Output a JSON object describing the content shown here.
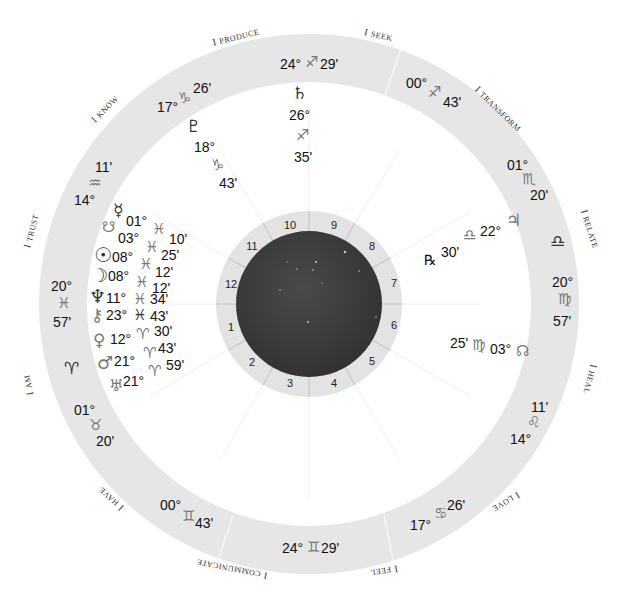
{
  "chart": {
    "center": [
      309,
      304
    ],
    "outer_ring": {
      "outer_radius": 270,
      "inner_radius": 222,
      "color": "#e6e6e6"
    },
    "house_wheel": {
      "outer_radius": 93,
      "inner_radius": 73,
      "color": "#e3e3e3",
      "divider_color": "#c8c8c8"
    },
    "sky_disc_color": "#3c3c3c"
  },
  "house_numbers": [
    "1",
    "2",
    "3",
    "4",
    "5",
    "6",
    "7",
    "8",
    "9",
    "10",
    "11",
    "12"
  ],
  "themes": [
    {
      "first": "I",
      "rest": "Produce"
    },
    {
      "first": "I",
      "rest": "Seek"
    },
    {
      "first": "I",
      "rest": "Transform"
    },
    {
      "first": "I",
      "rest": "Relate"
    },
    {
      "first": "I",
      "rest": "Heal"
    },
    {
      "first": "I",
      "rest": "Love"
    },
    {
      "first": "I",
      "rest": "Feel"
    },
    {
      "first": "I",
      "rest": "Communicate"
    },
    {
      "first": "I",
      "rest": "Have"
    },
    {
      "first": "I",
      "rest": "Am"
    },
    {
      "first": "I",
      "rest": "Trust"
    },
    {
      "first": "I",
      "rest": "Know"
    }
  ],
  "cusps": [
    {
      "deg": "24°",
      "sign": "♐",
      "min": "29'"
    },
    {
      "deg": "00°",
      "sign": "♐",
      "min": "43'"
    },
    {
      "deg": "01°",
      "sign": "♏",
      "min": "20'"
    },
    {
      "deg": "",
      "sign": "♎",
      "min": ""
    },
    {
      "deg": "20°",
      "sign": "♍",
      "min": "57'"
    },
    {
      "deg": "14°",
      "sign": "♌",
      "min": "11'"
    },
    {
      "deg": "17°",
      "sign": "♋",
      "min": "26'"
    },
    {
      "deg": "24°",
      "sign": "♊",
      "min": "29'"
    },
    {
      "deg": "00°",
      "sign": "♊",
      "min": "43'"
    },
    {
      "deg": "01°",
      "sign": "♉",
      "min": "20'"
    },
    {
      "deg": "",
      "sign": "♈",
      "min": ""
    },
    {
      "deg": "20°",
      "sign": "♓",
      "min": "57'"
    },
    {
      "deg": "14°",
      "sign": "♒",
      "min": "11'"
    },
    {
      "deg": "17°",
      "sign": "♑",
      "min": "26'"
    }
  ],
  "planets": [
    {
      "name": "Pluto",
      "glyph": "♇",
      "deg": "18°",
      "sign": "♑",
      "min": "43'"
    },
    {
      "name": "Saturn",
      "glyph": "♄",
      "deg": "26°",
      "sign": "♐",
      "min": "35'"
    },
    {
      "name": "Mercury",
      "glyph": "☿",
      "deg": "01°",
      "sign": "♓",
      "min": "10'"
    },
    {
      "name": "South Node",
      "glyph": "☋",
      "deg": "03°",
      "sign": "♓",
      "min": "25'"
    },
    {
      "name": "Sun",
      "glyph": "☉",
      "deg": "08°",
      "sign": "♓",
      "min": "12'"
    },
    {
      "name": "Moon",
      "glyph": "☽",
      "deg": "08°",
      "sign": "♓",
      "min": "12'"
    },
    {
      "name": "Neptune",
      "glyph": "♆",
      "deg": "11°",
      "sign": "♓",
      "min": "34'"
    },
    {
      "name": "Chiron",
      "glyph": "⚷",
      "deg": "23°",
      "sign": "♓",
      "min": "43'"
    },
    {
      "name": "Venus",
      "glyph": "♀",
      "deg": "12°",
      "sign": "♈",
      "min": "30'"
    },
    {
      "name": "Mars",
      "glyph": "♂",
      "deg": "21°",
      "sign": "♈",
      "min": "43'"
    },
    {
      "name": "Uranus",
      "glyph": "♅",
      "deg": "21°",
      "sign": "♈",
      "min": "59'"
    },
    {
      "name": "Jupiter",
      "glyph": "♃",
      "deg": "22°",
      "sign": "♎",
      "min": "30'",
      "retrograde": "℞"
    },
    {
      "name": "North Node",
      "glyph": "☊",
      "deg": "03°",
      "sign": "♍",
      "min": "25'"
    }
  ]
}
